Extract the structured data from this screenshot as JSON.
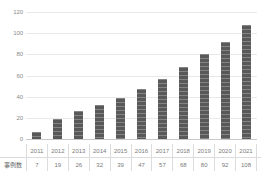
{
  "chart_data": {
    "type": "bar",
    "title": "",
    "subtitle": "",
    "xlabel": "",
    "ylabel": "",
    "categories": [
      "2011",
      "2012",
      "2013",
      "2014",
      "2015",
      "2016",
      "2017",
      "2018",
      "2019",
      "2020",
      "2021"
    ],
    "values": [
      7,
      19,
      26,
      32,
      39,
      47,
      57,
      68,
      80,
      92,
      108
    ],
    "series": [
      {
        "name": "事例数",
        "values": [
          7,
          19,
          26,
          32,
          39,
          47,
          57,
          68,
          80,
          92,
          108
        ]
      }
    ],
    "ylim": [
      0,
      120
    ],
    "y_ticks": [
      0,
      20,
      40,
      60,
      80,
      100,
      120
    ],
    "y_tick_labels": [
      "0",
      "20",
      "40",
      "60",
      "80",
      "100",
      "120"
    ],
    "grid": "horizontal",
    "legend": "none",
    "bar_color": "#595959",
    "grid_color": "#e9e9e9",
    "axis_color": "#c9c9c9",
    "text_color": "#7b7b7b"
  },
  "table": {
    "row_label": "事例数",
    "years": [
      "2011",
      "2012",
      "2013",
      "2014",
      "2015",
      "2016",
      "2017",
      "2018",
      "2019",
      "2020",
      "2021"
    ],
    "values": [
      "7",
      "19",
      "26",
      "32",
      "39",
      "47",
      "57",
      "68",
      "80",
      "92",
      "108"
    ]
  }
}
